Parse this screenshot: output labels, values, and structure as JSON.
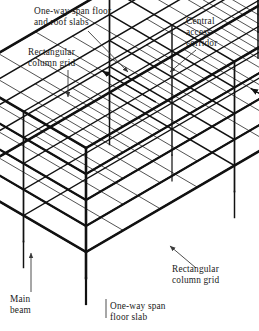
{
  "figure": {
    "kind": "isometric-structural-frame-diagram",
    "background_color": "#ffffff",
    "line_color": "#111111",
    "leader_color": "#3a3a3a"
  },
  "callouts": [
    {
      "id": "one-way-span-floor-and-roof-slabs",
      "text": "One-way span floor\nand roof slabs",
      "x": 34,
      "y": 6,
      "width": 120,
      "align": "left",
      "leader": [
        [
          88,
          31
        ],
        [
          128,
          72
        ]
      ],
      "arrow": true
    },
    {
      "id": "rectangular-column-grid-top",
      "text": "Rectangular\ncolumn grid",
      "x": 28,
      "y": 47,
      "width": 80,
      "align": "left",
      "leader": [
        [
          68,
          70
        ],
        [
          68,
          97
        ]
      ],
      "arrow": true
    },
    {
      "id": "central-access-corridor",
      "text": "Central\naccess\ncorridor",
      "x": 186,
      "y": 16,
      "width": 62,
      "align": "left",
      "leader": [
        [
          196,
          50
        ],
        [
          170,
          72
        ]
      ],
      "arrow": true
    },
    {
      "id": "rectangular-column-grid-right",
      "text": "Rectangular\ncolumn grid",
      "x": 172,
      "y": 264,
      "width": 84,
      "align": "left",
      "leader": [
        [
          196,
          268
        ],
        [
          170,
          246
        ]
      ],
      "arrow": true
    },
    {
      "id": "main-beam",
      "text": "Main\nbeam",
      "x": 10,
      "y": 294,
      "width": 46,
      "align": "left",
      "leader": [
        [
          31,
          292
        ],
        [
          31,
          253
        ]
      ],
      "arrow": true
    },
    {
      "id": "one-way-span-floor-slab",
      "text": "One-way span\nfloor slab",
      "x": 110,
      "y": 301,
      "width": 84,
      "align": "left",
      "leader": [
        [
          106,
          318
        ],
        [
          106,
          299
        ]
      ],
      "arrow": false
    }
  ],
  "geometry": {
    "note": "Isometric box: origin is front-bottom corner; axes u (to back-left), v (to back-right), w (up).",
    "origin": {
      "x": 86,
      "y": 278
    },
    "axis_u": {
      "dx": -62.5,
      "dy": -36.5
    },
    "axis_v": {
      "dx": 148.5,
      "dy": -86.5
    },
    "axis_w": {
      "dx": 0,
      "dy": -26.0
    },
    "bays_u": 2,
    "bays_v": 4,
    "storeys": 5,
    "column_stub_length": 26,
    "stroke_heavy": 2.6,
    "stroke_medium": 1.5,
    "stroke_light": 0.85,
    "slab_ribs_per_bay": 3
  },
  "span_arrows": [
    {
      "id": "roof-span-arrow-a",
      "u": 0.5,
      "v": 0.5,
      "level": 5,
      "dir": "u"
    },
    {
      "id": "roof-span-arrow-b",
      "u": 0.5,
      "v": 1.5,
      "level": 5,
      "dir": "u"
    },
    {
      "id": "roof-span-arrow-c",
      "u": 1.5,
      "v": 2.5,
      "level": 5,
      "dir": "u"
    },
    {
      "id": "roof-span-arrow-d",
      "u": 1.5,
      "v": 3.5,
      "level": 5,
      "dir": "u"
    },
    {
      "id": "ground-span-arrow-a",
      "u": 0.5,
      "v": 1.5,
      "level": 1,
      "dir": "u"
    },
    {
      "id": "ground-span-arrow-b",
      "u": 0.5,
      "v": 2.6,
      "level": 1,
      "dir": "u"
    }
  ]
}
